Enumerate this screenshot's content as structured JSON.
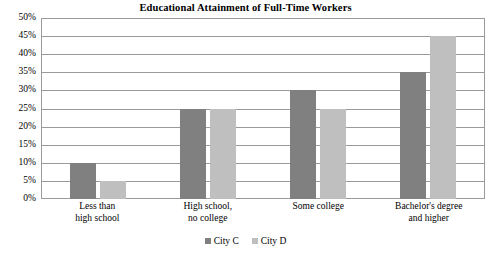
{
  "chart_data": {
    "type": "bar",
    "title": "Educational Attainment of Full-Time Workers",
    "xlabel": "",
    "ylabel": "",
    "ylim": [
      0,
      50
    ],
    "ytick_step": 5,
    "ytick_labels": [
      "50%",
      "45%",
      "40%",
      "35%",
      "30%",
      "25%",
      "20%",
      "15%",
      "10%",
      "5%",
      "0%"
    ],
    "grid": true,
    "legend_position": "bottom-center",
    "categories": [
      [
        "Less than",
        "high school"
      ],
      [
        "High school,",
        "no college"
      ],
      [
        "Some college",
        ""
      ],
      [
        "Bachelor's degree",
        "and higher"
      ]
    ],
    "series": [
      {
        "name": "City C",
        "color": "#808080",
        "values": [
          10,
          25,
          30,
          35
        ]
      },
      {
        "name": "City D",
        "color": "#bfbfbf",
        "values": [
          5,
          25,
          25,
          45
        ]
      }
    ]
  }
}
